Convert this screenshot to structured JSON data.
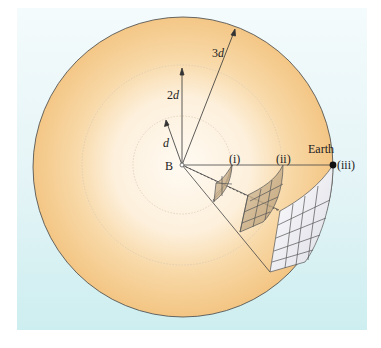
{
  "diagram": {
    "center_label": "B",
    "radius_labels": [
      "d",
      "2d",
      "3d"
    ],
    "point_labels": [
      "(i)",
      "(ii)",
      "(iii)"
    ],
    "earth_label": "Earth",
    "colors": {
      "background": "#e4f4f6",
      "sphere_outer": "#f5c98a",
      "sphere_inner": "#fff8ee",
      "patch_small": "#c9b08c",
      "patch_large": "#f0f0f4",
      "line": "#333333"
    }
  }
}
